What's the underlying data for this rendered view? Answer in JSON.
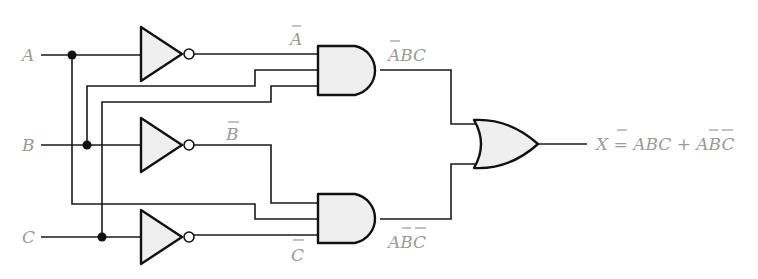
{
  "diagram": {
    "type": "logic-circuit",
    "inputs": [
      {
        "name": "A",
        "label": "A"
      },
      {
        "name": "B",
        "label": "B"
      },
      {
        "name": "C",
        "label": "C"
      }
    ],
    "inverted_labels": {
      "a_not": "A",
      "b_not": "B",
      "c_not": "C"
    },
    "gate_labels": {
      "and_top": "ABC",
      "and_bottom": "ABC"
    },
    "output": {
      "label_prefix": "X = ",
      "term1": "ABC",
      "plus": " + ",
      "term2": "ABC",
      "expression": "X = A̅BC + AB̅C̅"
    },
    "gates": [
      {
        "id": "not-a",
        "type": "NOT",
        "input": "A",
        "output": "A̅"
      },
      {
        "id": "not-b",
        "type": "NOT",
        "input": "B",
        "output": "B̅"
      },
      {
        "id": "not-c",
        "type": "NOT",
        "input": "C",
        "output": "C̅"
      },
      {
        "id": "and-top",
        "type": "AND",
        "inputs": [
          "A̅",
          "B",
          "C"
        ],
        "output": "A̅BC"
      },
      {
        "id": "and-bottom",
        "type": "AND",
        "inputs": [
          "B̅",
          "A",
          "C̅"
        ],
        "output": "AB̅C̅"
      },
      {
        "id": "or-out",
        "type": "OR",
        "inputs": [
          "A̅BC",
          "AB̅C̅"
        ],
        "output": "X"
      }
    ],
    "colors": {
      "wire": "#1a1a1a",
      "gate_fill": "#efefef",
      "label": "#9a9a9a"
    }
  }
}
